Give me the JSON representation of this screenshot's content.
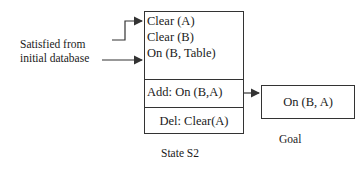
{
  "state": {
    "preconditions": [
      "Clear (A)",
      "Clear (B)",
      "On (B, Table)"
    ],
    "add": "Add: On (B,A)",
    "del": "Del: Clear(A)",
    "caption": "State S2"
  },
  "goal": {
    "label": "On (B, A)",
    "caption": "Goal"
  },
  "annotation": {
    "line1": "Satisfied from",
    "line2": "initial database"
  },
  "colors": {
    "stroke": "#333333",
    "text": "#1a1a1a",
    "background": "#ffffff"
  }
}
